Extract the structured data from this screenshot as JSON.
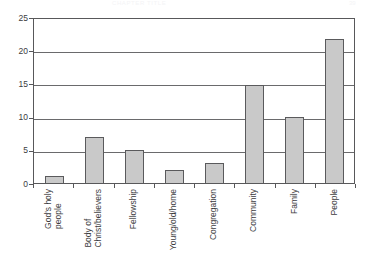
{
  "page_header": {
    "title": "CHAPTER TITLE",
    "page_number": "39"
  },
  "chart_data": {
    "type": "bar",
    "title": "",
    "subtitle": "",
    "xlabel": "",
    "ylabel": "",
    "ylim": [
      0,
      25
    ],
    "ytick_labels": [
      "25",
      "20",
      "15",
      "10",
      "5",
      "0"
    ],
    "yticks": [
      25,
      20,
      15,
      10,
      5,
      0
    ],
    "grid": true,
    "legend": false,
    "legend_position": "none",
    "orientation": "vertical",
    "bar_fill_color": "#c9c9c9",
    "bar_border_color": "#5a5a5c",
    "axis_color": "#58585a",
    "categories": [
      "God's holy people",
      "Body of Christ/believers",
      "Fellowship",
      "Young/old/home",
      "Congregation",
      "Community",
      "Family",
      "People"
    ],
    "category_lines": [
      [
        "God's holy",
        "people"
      ],
      [
        "Body of",
        "Christ/believers"
      ],
      [
        "Fellowship",
        ""
      ],
      [
        "Young/old/home",
        ""
      ],
      [
        "Congregation",
        ""
      ],
      [
        "Community",
        ""
      ],
      [
        "Family",
        ""
      ],
      [
        "People",
        ""
      ]
    ],
    "values": [
      1,
      7,
      5,
      2,
      3,
      15,
      10,
      22
    ]
  }
}
